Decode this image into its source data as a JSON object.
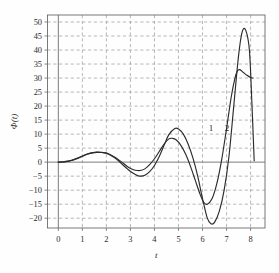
{
  "chart_data": {
    "type": "line",
    "title": "",
    "xlabel": "t",
    "ylabel": "Φ(t)",
    "xlim": [
      -0.45,
      8.6
    ],
    "ylim": [
      -23.5,
      52.5
    ],
    "xticks": [
      0,
      1,
      2,
      3,
      4,
      5,
      6,
      7,
      8
    ],
    "xtick_labels": [
      "0",
      "1",
      "2",
      "3",
      "4",
      "5",
      "6",
      "7",
      "8"
    ],
    "yticks": [
      -20,
      -15,
      -10,
      -5,
      0,
      5,
      10,
      15,
      20,
      25,
      30,
      35,
      40,
      45,
      50
    ],
    "ytick_labels": [
      "−20",
      "−15",
      "−10",
      "−5",
      "0",
      "5",
      "10",
      "15",
      "20",
      "25",
      "30",
      "35",
      "40",
      "45",
      "50"
    ],
    "grid": true,
    "grid_style": "dashed",
    "grid_color": "#9a9a9a",
    "legend": "none",
    "annotations": [
      {
        "text": "1",
        "x": 6.35,
        "y": 11.0
      },
      {
        "text": "2",
        "x": 7.02,
        "y": 11.0
      }
    ],
    "series": [
      {
        "name": "1",
        "color": "#2b2b2b",
        "x": [
          0.0,
          0.2,
          0.4,
          0.6,
          0.8,
          1.0,
          1.2,
          1.4,
          1.6,
          1.8,
          1.95,
          2.1,
          2.3,
          2.5,
          2.7,
          2.9,
          3.1,
          3.3,
          3.45,
          3.6,
          3.8,
          4.0,
          4.2,
          4.4,
          4.6,
          4.75,
          4.9,
          5.1,
          5.3,
          5.5,
          5.7,
          5.9,
          6.05,
          6.2,
          6.4,
          6.6,
          6.8,
          7.0,
          7.2,
          7.35,
          7.45,
          7.55,
          7.7,
          7.85,
          8.0,
          8.1
        ],
        "y": [
          0.0,
          0.1,
          0.35,
          0.8,
          1.5,
          2.2,
          2.9,
          3.3,
          3.5,
          3.45,
          3.3,
          2.9,
          2.0,
          0.9,
          -0.4,
          -1.7,
          -2.6,
          -3.0,
          -2.9,
          -2.4,
          -0.9,
          1.2,
          3.8,
          6.4,
          8.3,
          8.5,
          8.0,
          6.0,
          2.8,
          -1.5,
          -6.5,
          -11.5,
          -14.3,
          -15.0,
          -13.0,
          -7.5,
          1.0,
          12.0,
          23.5,
          30.0,
          32.5,
          33.0,
          32.0,
          31.0,
          30.2,
          30.0
        ]
      },
      {
        "name": "2",
        "color": "#2b2b2b",
        "x": [
          0.0,
          0.2,
          0.4,
          0.6,
          0.8,
          1.0,
          1.2,
          1.4,
          1.6,
          1.8,
          1.95,
          2.1,
          2.3,
          2.5,
          2.7,
          2.9,
          3.1,
          3.3,
          3.45,
          3.6,
          3.8,
          4.0,
          4.2,
          4.4,
          4.6,
          4.85,
          5.0,
          5.2,
          5.4,
          5.6,
          5.8,
          6.0,
          6.2,
          6.35,
          6.5,
          6.7,
          6.9,
          7.1,
          7.3,
          7.5,
          7.65,
          7.8,
          7.95,
          8.05,
          8.15
        ],
        "y": [
          0.0,
          0.05,
          0.25,
          0.65,
          1.3,
          2.0,
          2.8,
          3.3,
          3.55,
          3.5,
          3.3,
          2.85,
          1.8,
          0.5,
          -1.1,
          -2.6,
          -3.9,
          -4.8,
          -5.0,
          -4.7,
          -3.4,
          -1.2,
          2.0,
          6.0,
          9.8,
          12.0,
          11.8,
          10.0,
          6.5,
          1.5,
          -5.0,
          -13.0,
          -20.0,
          -22.0,
          -21.5,
          -17.5,
          -10.0,
          2.0,
          20.0,
          38.0,
          46.5,
          47.0,
          40.0,
          22.0,
          0.5
        ]
      }
    ]
  },
  "figure": {
    "caption": ""
  }
}
